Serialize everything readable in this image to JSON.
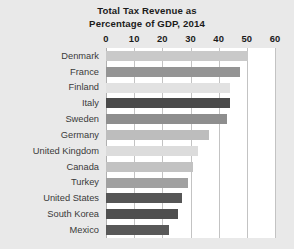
{
  "chart_data": {
    "type": "bar",
    "orientation": "horizontal",
    "title": "Total Tax Revenue as Percentage of GDP, 2014",
    "title_lines": [
      "Total Tax Revenue as",
      "Percentage of GDP, 2014"
    ],
    "xlabel": "",
    "ylabel": "",
    "xlim": [
      0,
      60
    ],
    "xticks": [
      0,
      10,
      20,
      30,
      40,
      50,
      60
    ],
    "xtick_labels": [
      "0",
      "10",
      "20",
      "30",
      "40",
      "50",
      "60"
    ],
    "grid": true,
    "grid_axis": "x",
    "legend": false,
    "categories": [
      "Denmark",
      "France",
      "Finland",
      "Italy",
      "Sweden",
      "Germany",
      "United Kingdom",
      "Canada",
      "Turkey",
      "United States",
      "South Korea",
      "Mexico"
    ],
    "values": [
      50.5,
      47.5,
      44.0,
      44.0,
      43.0,
      36.5,
      32.5,
      31.0,
      29.0,
      27.0,
      25.5,
      22.5
    ],
    "bar_colors": [
      "#c9c9c9",
      "#949494",
      "#e2e2e2",
      "#4a4a4a",
      "#8e8e8e",
      "#bdbdbd",
      "#dcdcdc",
      "#c2c2c2",
      "#a0a0a0",
      "#565656",
      "#4f4f4f",
      "#585858"
    ]
  },
  "style": {
    "page_background": "#e9e9e9",
    "plot_background": "#ffffff",
    "gridline_color": "#c3c3c3",
    "axis_color": "#b0b0b0",
    "title_color": "#1b1b1b",
    "tick_color": "#1b1b1b",
    "category_color": "#3a3a3a"
  }
}
